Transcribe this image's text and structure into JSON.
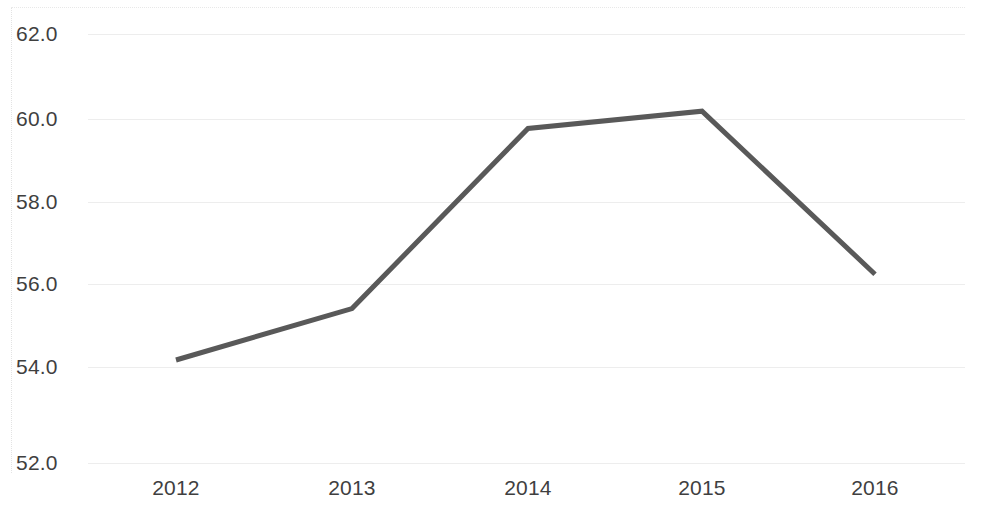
{
  "chart_data": {
    "type": "line",
    "title": "",
    "subtitle": "",
    "xlabel": "",
    "ylabel": "",
    "categories": [
      "2012",
      "2013",
      "2014",
      "2015",
      "2016"
    ],
    "series": [
      {
        "name": "Series 1",
        "values": [
          54.4,
          55.6,
          59.8,
          60.2,
          56.4
        ],
        "color": "#595959",
        "line_width": 5
      }
    ],
    "x": [
      "2012",
      "2013",
      "2014",
      "2015",
      "2016"
    ],
    "values": [
      54.4,
      55.6,
      59.8,
      60.2,
      56.4
    ],
    "ylim": [
      52.0,
      62.0
    ],
    "y_ticks": [
      "52.0",
      "54.0",
      "56.0",
      "58.0",
      "60.0",
      "62.0"
    ],
    "y_tick_values": [
      52.0,
      54.0,
      56.0,
      58.0,
      60.0,
      62.0
    ],
    "x_ticks": [
      "2012",
      "2013",
      "2014",
      "2015",
      "2016"
    ],
    "grid": "horizontal",
    "grid_color": "#ededed",
    "legend": "none",
    "markers": "none",
    "annotations": [],
    "axis_text_color": "#3f3f3f",
    "background_color": "#ffffff",
    "border_color": "#e3e3e3"
  },
  "axes": {
    "y_labels": [
      {
        "text": "62.0",
        "top": 23
      },
      {
        "text": "60.0",
        "top": 108
      },
      {
        "text": "58.0",
        "top": 191
      },
      {
        "text": "56.0",
        "top": 273
      },
      {
        "text": "54.0",
        "top": 356
      },
      {
        "text": "52.0",
        "top": 452
      }
    ],
    "x_labels": [
      {
        "text": "2012",
        "left": 116
      },
      {
        "text": "2013",
        "left": 292
      },
      {
        "text": "2014",
        "left": 468
      },
      {
        "text": "2015",
        "left": 642
      },
      {
        "text": "2016",
        "left": 815
      }
    ],
    "gridlines": [
      34,
      119,
      202,
      284,
      367,
      463
    ]
  },
  "plot_points": {
    "polyline": "176,355 352,305 528,127 702,113 875,275"
  }
}
